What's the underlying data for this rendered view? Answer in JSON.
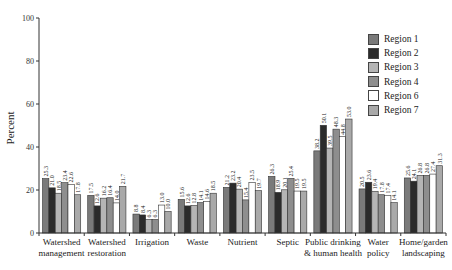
{
  "chart_data": {
    "type": "bar",
    "title": "",
    "xlabel": "",
    "ylabel": "Percent",
    "ylim": [
      0,
      100
    ],
    "yticks": [
      0,
      20,
      40,
      60,
      80,
      100
    ],
    "grid": false,
    "legend_position": "upper right",
    "categories": [
      "Watershed management",
      "Watershed restoration",
      "Irrigation",
      "Waste",
      "Nutrient",
      "Septic",
      "Public drinking & human health",
      "Water policy",
      "Home/garden landscaping"
    ],
    "category_lines": [
      [
        "Watershed",
        "management"
      ],
      [
        "Watershed",
        "restoration"
      ],
      [
        "Irrigation"
      ],
      [
        "Waste"
      ],
      [
        "Nutrient"
      ],
      [
        "Septic"
      ],
      [
        "Public drinking",
        "& human health"
      ],
      [
        "Water",
        "policy"
      ],
      [
        "Home/garden",
        "landscaping"
      ]
    ],
    "series": [
      {
        "name": "Region 1",
        "color": "#7a7a7a",
        "values": [
          25.3,
          17.5,
          8.8,
          15.6,
          21.2,
          26.3,
          38.2,
          20.5,
          25.6
        ]
      },
      {
        "name": "Region 2",
        "color": "#2b2b2b",
        "values": [
          21.0,
          12.6,
          8.4,
          12.6,
          23.2,
          18.9,
          50.1,
          23.6,
          24.1
        ]
      },
      {
        "name": "Region 3",
        "color": "#b5b5b5",
        "values": [
          18.5,
          16.2,
          6.3,
          12.8,
          20.4,
          20.1,
          39.5,
          19.4,
          26.8
        ]
      },
      {
        "name": "Region 4",
        "color": "#8e8e8e",
        "values": [
          23.4,
          16.4,
          6.3,
          14.1,
          15.4,
          25.4,
          48.3,
          17.8,
          26.8
        ]
      },
      {
        "name": "Region 6",
        "color": "#ffffff",
        "values": [
          22.6,
          14.0,
          13.0,
          14.6,
          23.5,
          19.5,
          44.8,
          17.4,
          27.4
        ]
      },
      {
        "name": "Region 7",
        "color": "#a9a9a9",
        "values": [
          17.8,
          21.7,
          10.0,
          18.5,
          19.7,
          19.5,
          53.0,
          14.1,
          31.3
        ]
      }
    ]
  },
  "legend": {
    "items": [
      {
        "label": "Region 1",
        "color": "#7a7a7a"
      },
      {
        "label": "Region 2",
        "color": "#2b2b2b"
      },
      {
        "label": "Region 3",
        "color": "#b5b5b5"
      },
      {
        "label": "Region 4",
        "color": "#8e8e8e"
      },
      {
        "label": "Region 6",
        "color": "#ffffff"
      },
      {
        "label": "Region 7",
        "color": "#a9a9a9"
      }
    ]
  }
}
